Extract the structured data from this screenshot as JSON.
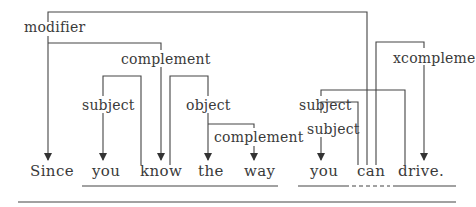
{
  "diagram": {
    "type": "dependency-parse",
    "words": [
      "Since",
      "you",
      "know",
      "the",
      "way",
      "you",
      "can",
      "drive."
    ],
    "relations": [
      {
        "label": "modifier",
        "head": "can",
        "dependent": "Since"
      },
      {
        "label": "complement",
        "head": "Since",
        "dependent": "know"
      },
      {
        "label": "subject",
        "head": "know",
        "dependent": "you"
      },
      {
        "label": "object",
        "head": "know",
        "dependent": "the"
      },
      {
        "label": "complement",
        "head": "the",
        "dependent": "way"
      },
      {
        "label": "xcompleme",
        "head": "can",
        "dependent": "drive."
      },
      {
        "label": "subject",
        "head": "drive.",
        "dependent": "you"
      },
      {
        "label": "subject",
        "head": "can",
        "dependent": "you"
      }
    ],
    "labels": {
      "modifier": "modifier",
      "complement_top": "complement",
      "subject_left": "subject",
      "object": "object",
      "complement_low": "complement",
      "xcomplement": "xcompleme",
      "subject_upper_right": "subject",
      "subject_lower_right": "subject"
    }
  }
}
